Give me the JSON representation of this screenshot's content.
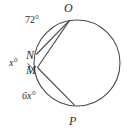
{
  "figure": {
    "kind": "circle-geometry-diagram",
    "background_color": "#ffffff",
    "stroke_color": "#4a4a4a",
    "text_color": "#2b2b2b",
    "circle": {
      "cx": 77,
      "cy": 63,
      "r": 43
    },
    "points": [
      {
        "name": "O",
        "label": "O",
        "x": 69,
        "y": 20
      },
      {
        "name": "N",
        "label": "N",
        "x": 37,
        "y": 58
      },
      {
        "name": "M",
        "label": "M",
        "x": 38,
        "y": 70
      },
      {
        "name": "P",
        "label": "P",
        "x": 74,
        "y": 106
      }
    ],
    "chords": [
      {
        "name": "chord-N-O",
        "from": "N",
        "to": "O"
      },
      {
        "name": "chord-M-O",
        "from": "M",
        "to": "O"
      },
      {
        "name": "chord-vertex-P",
        "from": "M",
        "to": "P"
      }
    ],
    "labels": {
      "arc_NO": "72°",
      "angle_at_vertex": "x°",
      "arc_MP": "6x°",
      "point_O": "O",
      "point_N": "N",
      "point_M": "M",
      "point_P": "P"
    }
  }
}
